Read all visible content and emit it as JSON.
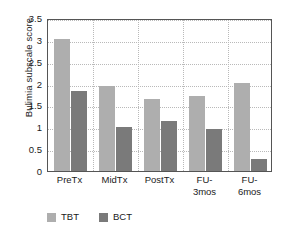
{
  "chart_data": {
    "type": "bar",
    "title": "",
    "xlabel": "",
    "ylabel": "Bulimia subscale score",
    "categories": [
      "PreTx",
      "MidTx",
      "PostTx",
      "FU-\n3mos",
      "FU-\n6mos"
    ],
    "series": [
      {
        "name": "TBT",
        "color": "#aeaeae",
        "values": [
          3.02,
          1.94,
          1.65,
          1.71,
          2.02
        ]
      },
      {
        "name": "BCT",
        "color": "#7a7a7a",
        "values": [
          1.82,
          1.01,
          1.15,
          0.95,
          0.27
        ]
      }
    ],
    "ylim": [
      0,
      3.5
    ],
    "yticks": [
      0,
      0.5,
      1,
      1.5,
      2,
      2.5,
      3,
      3.5
    ],
    "ytick_labels": [
      "0",
      "0.5",
      "1",
      "1.5",
      "2",
      "2.5",
      "3",
      "3.5"
    ],
    "grid": true,
    "grid_style": "dotted",
    "legend_position": "bottom-left",
    "axis_color": "#555555",
    "grid_color": "#b9b9b9"
  }
}
